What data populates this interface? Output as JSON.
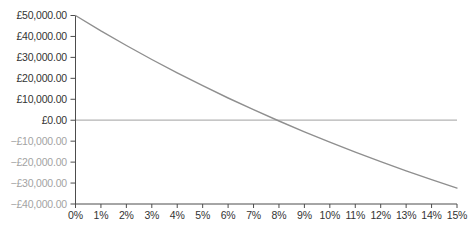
{
  "colors": {
    "background": "#ffffff",
    "curve": "#8f8f8f",
    "zero_line": "#b3b3b3",
    "axis": "#4d4d4d",
    "tick_label": "#333333",
    "negative_tick_label": "#a3a3a3"
  },
  "chart_data": {
    "type": "line",
    "title": "",
    "xlabel": "",
    "ylabel": "",
    "xlim": [
      0,
      15
    ],
    "ylim": [
      -40000,
      50000
    ],
    "grid": false,
    "legend": "none",
    "zero_line": true,
    "x": [
      0,
      1,
      2,
      3,
      4,
      5,
      6,
      7,
      8,
      9,
      10,
      11,
      12,
      13,
      14,
      15
    ],
    "x_tick_labels": [
      "0%",
      "1%",
      "2%",
      "3%",
      "4%",
      "5%",
      "6%",
      "7%",
      "8%",
      "9%",
      "10%",
      "11%",
      "12%",
      "13%",
      "14%",
      "15%"
    ],
    "series": [
      {
        "name": "Value",
        "values": [
          50000,
          42670,
          35675,
          28985,
          22590,
          16475,
          10620,
          5010,
          -365,
          -5515,
          -10460,
          -15205,
          -19760,
          -24140,
          -28345,
          -32390
        ]
      }
    ],
    "y_ticks": [
      {
        "value": 50000,
        "label": "£50,000.00"
      },
      {
        "value": 40000,
        "label": "£40,000.00"
      },
      {
        "value": 30000,
        "label": "£30,000.00"
      },
      {
        "value": 20000,
        "label": "£20,000.00"
      },
      {
        "value": 10000,
        "label": "£10,000.00"
      },
      {
        "value": 0,
        "label": "£0.00"
      },
      {
        "value": -10000,
        "label": "−£10,000.00"
      },
      {
        "value": -20000,
        "label": "−£20,000.00"
      },
      {
        "value": -30000,
        "label": "−£30,000.00"
      },
      {
        "value": -40000,
        "label": "−£40,000.00"
      }
    ]
  }
}
